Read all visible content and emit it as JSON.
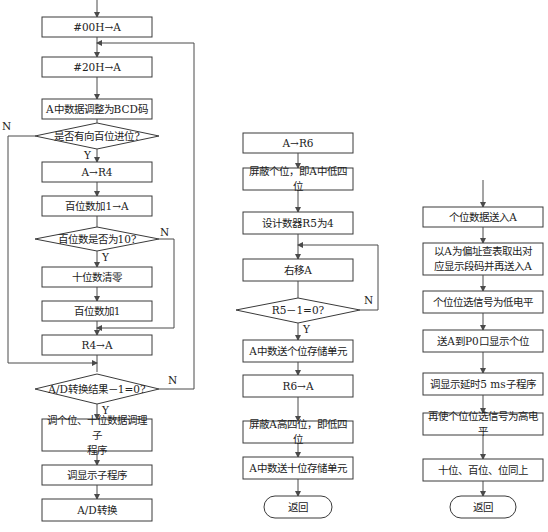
{
  "left": {
    "steps": [
      {
        "id": "L1",
        "text": "#00H→A"
      },
      {
        "id": "L2",
        "text": "#20H→A"
      },
      {
        "id": "L3",
        "text": "A中数据调整为BCD码"
      },
      {
        "id": "D1",
        "text": "是否有向百位进位?"
      },
      {
        "id": "L4",
        "text": "A→R4"
      },
      {
        "id": "L5",
        "text": "百位数加1→A"
      },
      {
        "id": "D2",
        "text": "百位数是否为10?"
      },
      {
        "id": "L6",
        "text": "十位数清零"
      },
      {
        "id": "L7",
        "text": "百位数加1"
      },
      {
        "id": "L8",
        "text": "R4→A"
      },
      {
        "id": "D3",
        "text": "A/D转换结果－1=0?"
      },
      {
        "id": "L9",
        "text": "调个位、十位数据调理子\n程序"
      },
      {
        "id": "L10",
        "text": "调显示子程序"
      },
      {
        "id": "L11",
        "text": "A/D转换"
      }
    ]
  },
  "middle": {
    "steps": [
      {
        "id": "M1",
        "text": "A→R6"
      },
      {
        "id": "M2",
        "text": "屏蔽个位，即A中低四位"
      },
      {
        "id": "M3",
        "text": "设计数器R5为4"
      },
      {
        "id": "M4",
        "text": "右移A"
      },
      {
        "id": "D4",
        "text": "R5－1=0?"
      },
      {
        "id": "M5",
        "text": "A中数送个位存储单元"
      },
      {
        "id": "M6",
        "text": "R6→A"
      },
      {
        "id": "M7",
        "text": "屏蔽A高四位，即低四位"
      },
      {
        "id": "M8",
        "text": "A中数送十位存储单元"
      },
      {
        "id": "M9",
        "text": "返回"
      }
    ]
  },
  "right": {
    "steps": [
      {
        "id": "R1",
        "text": "个位数据送入A"
      },
      {
        "id": "R2",
        "text": "以A为偏址查表取出对\n应显示段码并再送入A"
      },
      {
        "id": "R3",
        "text": "个位位选信号为低电平"
      },
      {
        "id": "R4",
        "text": "送A到P0口显示个位"
      },
      {
        "id": "R5",
        "text": "调显示延时5 ms子程序"
      },
      {
        "id": "R6",
        "text": "再使个位位选信号为高电平"
      },
      {
        "id": "R7",
        "text": "十位、百位、位同上"
      },
      {
        "id": "R8",
        "text": "返回"
      }
    ]
  },
  "labels": {
    "yes": "Y",
    "no": "N"
  },
  "colors": {
    "line": "#4a4a4a",
    "text": "#222222",
    "background": "#ffffff"
  }
}
